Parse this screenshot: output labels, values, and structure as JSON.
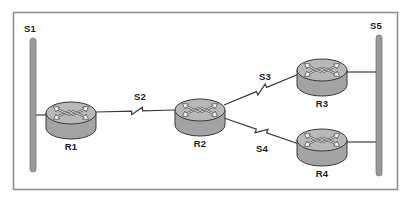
{
  "diagram": {
    "type": "network-topology",
    "frame": {
      "border_color": "#8f8f8f",
      "background": "#ffffff",
      "x": 13,
      "y": 12,
      "width": 385,
      "height": 178
    },
    "palette": {
      "router_top_fill": "#b8b8b8",
      "router_body_fill": "#a3a3a3",
      "router_outline": "#3a3a3a",
      "arrow_fill": "#ffffff",
      "arrow_outline": "#3a3a3a",
      "segment_bar_fill": "#9a9a9a",
      "segment_bar_outline": "#7a7a7a",
      "link_color": "#3a3a3a",
      "label_color": "#1c1c1c"
    },
    "segments": [
      {
        "id": "S1",
        "label": "S1",
        "kind": "lan-bar",
        "x": 33,
        "y_top": 38,
        "y_bottom": 172,
        "label_x": 30,
        "label_y": 32
      },
      {
        "id": "S5",
        "label": "S5",
        "kind": "lan-bar",
        "x": 379,
        "y_top": 35,
        "y_bottom": 176,
        "label_x": 376,
        "label_y": 29
      }
    ],
    "routers": [
      {
        "id": "R1",
        "label": "R1",
        "cx": 71,
        "cy": 113,
        "rx": 25,
        "ry": 11,
        "body_h": 15,
        "label_x": 71,
        "label_y": 150
      },
      {
        "id": "R2",
        "label": "R2",
        "cx": 200,
        "cy": 110,
        "rx": 25,
        "ry": 11,
        "body_h": 15,
        "label_x": 200,
        "label_y": 147
      },
      {
        "id": "R3",
        "label": "R3",
        "cx": 322,
        "cy": 70,
        "rx": 25,
        "ry": 11,
        "body_h": 15,
        "label_x": 322,
        "label_y": 107
      },
      {
        "id": "R4",
        "label": "R4",
        "cx": 322,
        "cy": 140,
        "rx": 25,
        "ry": 11,
        "body_h": 15,
        "label_x": 322,
        "label_y": 177
      }
    ],
    "links": [
      {
        "id": "L-S1-R1",
        "kind": "ethernet",
        "label": "",
        "from": "S1",
        "to": "R1",
        "x1": 33,
        "y1": 115,
        "x2": 46,
        "y2": 115
      },
      {
        "id": "L-R1-R2",
        "kind": "serial",
        "label": "S2",
        "from": "R1",
        "to": "R2",
        "x1": 96,
        "y1": 112,
        "x2": 175,
        "y2": 110,
        "label_x": 140,
        "label_y": 100,
        "bolt_t": 0.52
      },
      {
        "id": "L-R2-R3",
        "kind": "serial",
        "label": "S3",
        "from": "R2",
        "to": "R3",
        "x1": 224,
        "y1": 105,
        "x2": 299,
        "y2": 74,
        "label_x": 265,
        "label_y": 80,
        "bolt_t": 0.5
      },
      {
        "id": "L-R2-R4",
        "kind": "serial",
        "label": "S4",
        "from": "R2",
        "to": "R4",
        "x1": 224,
        "y1": 118,
        "x2": 299,
        "y2": 144,
        "label_x": 262,
        "label_y": 152,
        "bolt_t": 0.5
      },
      {
        "id": "L-R3-S5",
        "kind": "ethernet",
        "label": "",
        "from": "R3",
        "to": "S5",
        "x1": 347,
        "y1": 72,
        "x2": 379,
        "y2": 72
      },
      {
        "id": "L-R4-S5",
        "kind": "ethernet",
        "label": "",
        "from": "R4",
        "to": "S5",
        "x1": 347,
        "y1": 142,
        "x2": 379,
        "y2": 142
      }
    ],
    "icon_names": {
      "router": "router-icon",
      "lan_segment": "lan-segment-icon",
      "serial_link": "serial-link-icon",
      "ethernet_link": "ethernet-link-icon"
    }
  }
}
